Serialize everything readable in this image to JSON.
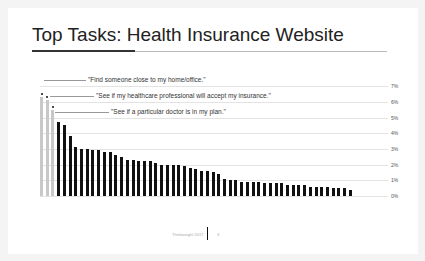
{
  "slide": {
    "title": "Top Tasks: Health Insurance Website",
    "footer_text": "Thinkweight 2017",
    "page_number": "3"
  },
  "chart_data": {
    "type": "bar",
    "title": "Top Tasks: Health Insurance Website",
    "xlabel": "",
    "ylabel": "",
    "ylim": [
      0,
      7
    ],
    "y_ticks": [
      "0%",
      "1%",
      "2%",
      "3%",
      "4%",
      "5%",
      "6%",
      "7%"
    ],
    "grid": true,
    "annotations": [
      {
        "bar_index": 0,
        "text": "\"Find someone close to my home/office.\""
      },
      {
        "bar_index": 1,
        "text": "\"See if my healthcare professional will accept my insurance.\""
      },
      {
        "bar_index": 2,
        "text": "\"See if a particular doctor is in my plan.\""
      }
    ],
    "highlight_color": "#c8c8c8",
    "bar_color": "#111111",
    "values": [
      6.3,
      6.1,
      5.5,
      4.7,
      4.5,
      3.8,
      3.1,
      3.0,
      3.0,
      2.9,
      2.9,
      2.8,
      2.8,
      2.6,
      2.5,
      2.3,
      2.3,
      2.2,
      2.2,
      2.2,
      2.1,
      2.0,
      2.0,
      2.0,
      2.0,
      1.9,
      1.8,
      1.7,
      1.6,
      1.6,
      1.5,
      1.4,
      1.1,
      1.0,
      1.0,
      0.9,
      0.9,
      0.9,
      0.9,
      0.8,
      0.8,
      0.8,
      0.8,
      0.7,
      0.7,
      0.7,
      0.7,
      0.6,
      0.6,
      0.6,
      0.6,
      0.5,
      0.5,
      0.5,
      0.4
    ]
  }
}
